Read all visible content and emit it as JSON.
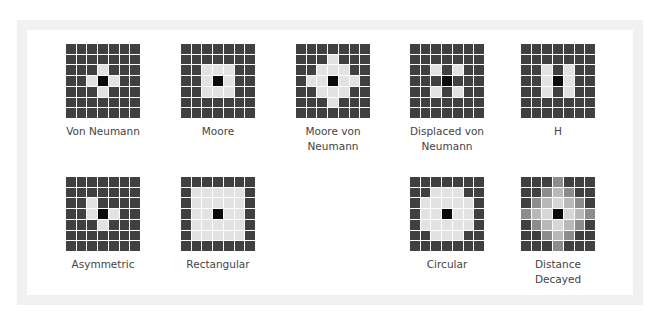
{
  "colors": {
    "empty": "#404040",
    "focal": "#0a0a0a",
    "neighbor": "#e2e2e2",
    "decay_1": "#d6d6d6",
    "decay_2": "#b8b8b8",
    "decay_3": "#8c8c8c"
  },
  "legend_note": "grid codes: 0=non-neighbor, 1=neighbor, 9=focal cell, 2/3/4=decayed weight levels",
  "neighborhoods": [
    {
      "label": "Von Neumann",
      "grid": [
        "0000000",
        "0000000",
        "0001000",
        "0019100",
        "0001000",
        "0000000",
        "0000000"
      ]
    },
    {
      "label": "Moore",
      "grid": [
        "0000000",
        "0000000",
        "0011100",
        "0019100",
        "0011100",
        "0000000",
        "0000000"
      ]
    },
    {
      "label": "Moore von Neumann",
      "grid": [
        "0000000",
        "0001000",
        "0011100",
        "0119110",
        "0011100",
        "0001000",
        "0000000"
      ]
    },
    {
      "label": "Displaced von Neumann",
      "grid": [
        "0000000",
        "0000000",
        "0010100",
        "0009000",
        "0010100",
        "0000000",
        "0000000"
      ]
    },
    {
      "label": "H",
      "grid": [
        "0000000",
        "0000000",
        "0010100",
        "0019100",
        "0010100",
        "0000000",
        "0000000"
      ]
    },
    {
      "label": "Asymmetric",
      "grid": [
        "0000000",
        "0000000",
        "0010000",
        "0019100",
        "0001000",
        "0000000",
        "0000000"
      ]
    },
    {
      "label": "Rectangular",
      "grid": [
        "0000000",
        "0111110",
        "0111110",
        "0119110",
        "0111110",
        "0111110",
        "0000000"
      ]
    },
    {
      "label": "Circular",
      "grid": [
        "0000000",
        "0011100",
        "0111110",
        "0119110",
        "0111110",
        "0011100",
        "0000000"
      ]
    },
    {
      "label": "Distance Decayed",
      "grid": [
        "0004000",
        "0043400",
        "0432340",
        "4329234",
        "0432340",
        "0043400",
        "0004000"
      ]
    }
  ]
}
